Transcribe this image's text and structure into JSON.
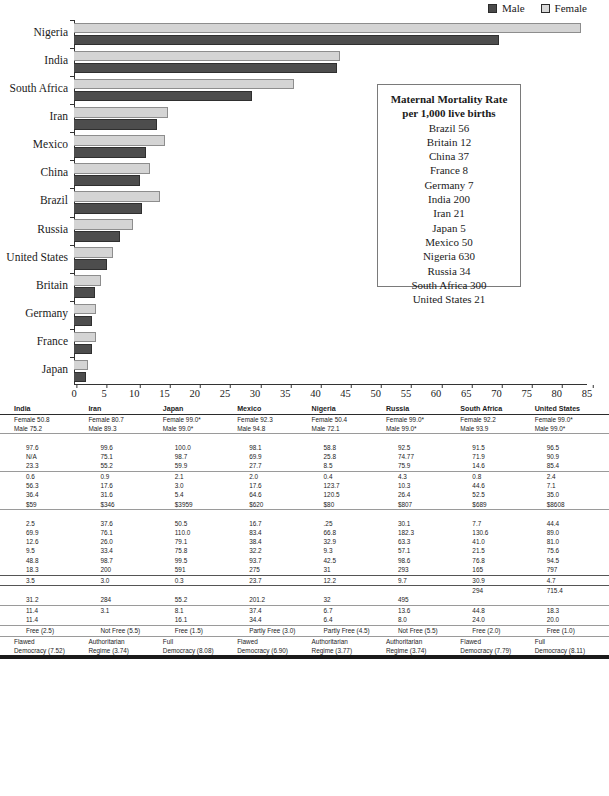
{
  "chart_data": {
    "type": "bar",
    "orientation": "horizontal",
    "title": "",
    "xlabel": "",
    "ylabel": "",
    "xlim": [
      0,
      85
    ],
    "xticks": [
      0,
      5,
      10,
      15,
      20,
      25,
      30,
      35,
      40,
      45,
      50,
      55,
      60,
      65,
      70,
      75,
      80,
      85
    ],
    "grid": false,
    "legend_position": "top-right",
    "legend": [
      "Male",
      "Female"
    ],
    "colors": {
      "male": "#4d4d4d",
      "female": "#d4d4d4"
    },
    "categories": [
      "Nigeria",
      "India",
      "South Africa",
      "Iran",
      "Mexico",
      "China",
      "Brazil",
      "Russia",
      "United States",
      "Britain",
      "Germany",
      "France",
      "Japan"
    ],
    "series": [
      {
        "name": "Male",
        "values": [
          70.5,
          43.5,
          29.5,
          13.8,
          12.0,
          11.0,
          11.2,
          7.7,
          5.4,
          3.4,
          2.9,
          2.9,
          2.0
        ]
      },
      {
        "name": "Female",
        "values": [
          84.0,
          44.0,
          36.5,
          15.6,
          15.0,
          12.6,
          14.2,
          9.7,
          6.4,
          4.4,
          3.7,
          3.7,
          2.3
        ]
      }
    ]
  },
  "maternal_box": {
    "title_line1": "Maternal Mortality Rate",
    "title_line2": "per 1,000 live births",
    "rows": [
      "Brazil 56",
      "Britain 12",
      "China 37",
      "France 8",
      "Germany 7",
      "India 200",
      "Iran 21",
      "Japan 5",
      "Mexico 50",
      "Nigeria 630",
      "Russia 34",
      "South Africa 300",
      "United States 21"
    ]
  },
  "table": {
    "columns": [
      "India",
      "Iran",
      "Japan",
      "Mexico",
      "Nigeria",
      "Russia",
      "South Africa",
      "United States"
    ],
    "sections": [
      {
        "rows": [
          {
            "cells": [
              "Female 50.8\nMale 75.2",
              "Female 80.7\nMale 89.3",
              "Female 99.0*\nMale 99.0*",
              "Female 92.3\nMale 94.8",
              "Female 50.4\nMale 72.1",
              "Female 99.0*\nMale 99.0*",
              "Female 92.2\nMale 93.9",
              "Female 99.0*\nMale 99.0*"
            ]
          }
        ]
      },
      {
        "rows": [
          {
            "cells": [
              "97.6",
              "99.6",
              "100.0",
              "98.1",
              "58.8",
              "92.5",
              "91.5",
              "96.5"
            ]
          },
          {
            "cells": [
              "N/A",
              "75.1",
              "98.7",
              "69.9",
              "25.8",
              "74.77",
              "71.9",
              "90.9"
            ]
          },
          {
            "cells": [
              "23.3",
              "55.2",
              "59.9",
              "27.7",
              "8.5",
              "75.9",
              "14.6",
              "85.4"
            ]
          }
        ]
      },
      {
        "rows": [
          {
            "cells": [
              "0.6",
              "0.9",
              "2.1",
              "2.0",
              "0.4",
              "4.3",
              "0.8",
              "2.4"
            ]
          },
          {
            "cells": [
              "56.3",
              "17.6",
              "3.0",
              "17.6",
              "123.7",
              "10.3",
              "44.6",
              "7.1"
            ]
          },
          {
            "cells": [
              "36.4",
              "31.6",
              "5.4",
              "64.6",
              "120.5",
              "26.4",
              "52.5",
              "35.0"
            ]
          },
          {
            "cells": [
              "$59",
              "$346",
              "$3959",
              "$620",
              "$80",
              "$807",
              "$689",
              "$8608"
            ]
          }
        ]
      },
      {
        "rows": [
          {
            "cells": [
              "2.5",
              "37.6",
              "50.5",
              "16.7",
              ".25",
              "30.1",
              "7.7",
              "44.4"
            ]
          },
          {
            "cells": [
              "69.9",
              "76.1",
              "110.0",
              "83.4",
              "66.8",
              "182.3",
              "130.6",
              "89.0"
            ]
          },
          {
            "cells": [
              "12.6",
              "26.0",
              "79.1",
              "38.4",
              "32.9",
              "63.3",
              "41.0",
              "81.0"
            ]
          },
          {
            "cells": [
              "9.5",
              "33.4",
              "75.8",
              "32.2",
              "9.3",
              "57.1",
              "21.5",
              "75.6"
            ]
          },
          {
            "cells": [
              "48.8",
              "98.7",
              "99.5",
              "93.7",
              "42.5",
              "98.6",
              "76.8",
              "94.5"
            ]
          },
          {
            "cells": [
              "18.3",
              "200",
              "591",
              "275",
              "31",
              "293",
              "165",
              "797"
            ]
          }
        ]
      },
      {
        "rows": [
          {
            "cells": [
              "3.5",
              "3.0",
              "0.3",
              "23.7",
              "12.2",
              "9.7",
              "30.9",
              "4.7"
            ]
          }
        ]
      },
      {
        "rows": [
          {
            "cells": [
              "",
              "",
              "",
              "",
              "",
              "",
              "294",
              "715.4"
            ]
          },
          {
            "cells": [
              "31.2",
              "284",
              "55.2",
              "201.2",
              "32",
              "495",
              "",
              ""
            ]
          }
        ]
      },
      {
        "rows": [
          {
            "cells": [
              "11.4",
              "3.1",
              "8.1",
              "37.4",
              "6.7",
              "13.6",
              "44.8",
              "18.3"
            ]
          },
          {
            "cells": [
              "11.4",
              "",
              "16.1",
              "34.4",
              "6.4",
              "8.0",
              "24.0",
              "20.0"
            ]
          }
        ]
      },
      {
        "rows": [
          {
            "cells": [
              "Free (2.5)",
              "Not Free (5.5)",
              "Free (1.5)",
              "Partly Free (3.0)",
              "Partly Free (4.5)",
              "Not Free (5.5)",
              "Free (2.0)",
              "Free (1.0)"
            ]
          }
        ]
      },
      {
        "rows": [
          {
            "cells": [
              "Flawed\nDemocracy (7.52)",
              "Authoritarian\nRegime (3.74)",
              "Full\nDemocracy (8.08)",
              "Flawed\nDemocracy (6.90)",
              "Authoritarian\nRegime (3.77)",
              "Authoritarian\nRegime (3.74)",
              "Flawed\nDemocracy (7.79)",
              "Full\nDemocracy (8.11)"
            ]
          }
        ]
      }
    ]
  }
}
